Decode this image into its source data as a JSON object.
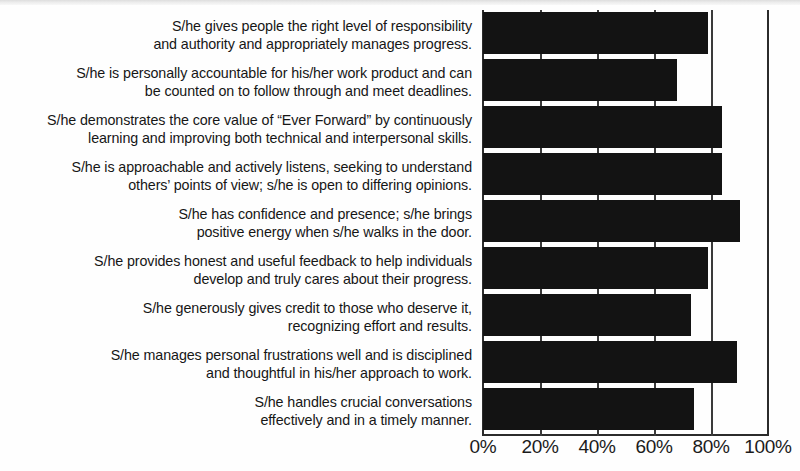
{
  "chart_data": {
    "type": "bar",
    "orientation": "horizontal",
    "title": "",
    "xlabel": "",
    "ylabel": "",
    "xlim": [
      0,
      100
    ],
    "grid": true,
    "legend": false,
    "tick_labels": [
      "0%",
      "20%",
      "40%",
      "60%",
      "80%",
      "100%"
    ],
    "tick_values": [
      0,
      20,
      40,
      60,
      80,
      100
    ],
    "categories": [
      "S/he gives people the right level of responsibility and authority and appropriately manages progress.",
      "S/he is personally accountable for his/her work product and can be counted on to follow through and meet deadlines.",
      "S/he demonstrates the core value of “Ever Forward” by continuously learning and improving both technical and interpersonal skills.",
      "S/he is approachable and actively listens, seeking to understand others’ points of view; s/he is open to differing opinions.",
      "S/he has confidence and presence; s/he brings positive energy when s/he walks in the door.",
      "S/he provides honest and useful feedback to help individuals develop and truly cares about their progress.",
      "S/he generously gives credit to those who deserve it, recognizing effort and results.",
      "S/he manages personal frustrations well and is disciplined and thoughtful in his/her approach to work.",
      "S/he handles crucial conversations effectively and in a timely manner."
    ],
    "values": [
      79,
      68,
      84,
      84,
      90,
      79,
      73,
      89,
      74
    ],
    "bar_color": "#131313",
    "axis_color": "#2b2b2b",
    "background_color": "#fefefe"
  },
  "labels": [
    {
      "line1": "S/he gives people the right level of responsibility",
      "line2": "and authority and appropriately manages progress."
    },
    {
      "line1": "S/he is personally accountable for his/her work product and can",
      "line2": "be counted on to follow through and meet deadlines."
    },
    {
      "line1": "S/he demonstrates the core value of “Ever Forward” by continuously",
      "line2": "learning and improving both technical and interpersonal skills."
    },
    {
      "line1": "S/he is approachable and actively listens, seeking to understand",
      "line2": "others’ points of view; s/he is open to differing opinions."
    },
    {
      "line1": "S/he has confidence and presence; s/he brings",
      "line2": "positive energy when s/he walks in the door."
    },
    {
      "line1": "S/he provides honest and useful feedback to help individuals",
      "line2": "develop and truly cares about their progress."
    },
    {
      "line1": "S/he generously gives credit to those who deserve it,",
      "line2": "recognizing effort and results."
    },
    {
      "line1": "S/he manages personal frustrations well and is disciplined",
      "line2": "and thoughtful in his/her approach to work."
    },
    {
      "line1": "S/he handles crucial conversations",
      "line2": "effectively and in a timely manner."
    }
  ]
}
